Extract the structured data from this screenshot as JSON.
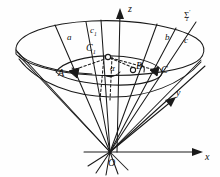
{
  "figure": {
    "kind": "geometry-diagram",
    "stroke_color": "#1a1a1a",
    "background_color": "#fefefe"
  },
  "axes": {
    "z": {
      "label": "z",
      "x": 128,
      "y": 4
    },
    "y": {
      "label": "y",
      "x": 176,
      "y": 93
    },
    "x": {
      "label": "x",
      "x": 205,
      "y": 152
    },
    "origin": {
      "label": "O",
      "x": 111,
      "y": 160
    }
  },
  "lines": [
    {
      "label": "a",
      "x": 67,
      "y": 37
    },
    {
      "label": "c",
      "sub": "1",
      "x": 92,
      "y": 30
    },
    {
      "label": "b",
      "x": 165,
      "y": 36
    },
    {
      "label": "c",
      "x": 184,
      "y": 39
    }
  ],
  "surface": {
    "label": "Σ",
    "sub": "1",
    "sup": "′",
    "x": 186,
    "y": 14
  },
  "points": [
    {
      "label": "A",
      "x": 63,
      "y": 72,
      "marker": "filled"
    },
    {
      "label": "B",
      "x": 136,
      "y": 66,
      "marker": "hollow"
    },
    {
      "label": "C",
      "x": 160,
      "y": 70,
      "marker": "filled"
    },
    {
      "label": "C",
      "sub": "1",
      "x": 88,
      "y": 47,
      "marker": "hollow"
    }
  ],
  "angles": [
    {
      "label": "α",
      "x": 113,
      "y": 68
    }
  ]
}
